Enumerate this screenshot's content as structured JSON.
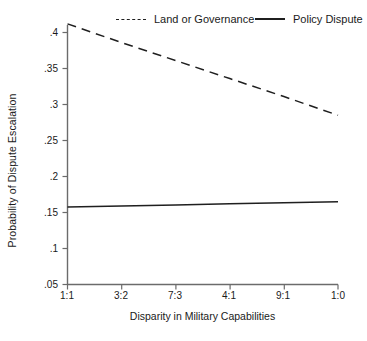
{
  "chart_data": {
    "type": "line",
    "title": "",
    "subtitle": "",
    "xlabel": "Disparity in Military Capabilities",
    "ylabel": "Probability of Dispute Escalation",
    "categories": [
      "1:1",
      "3:2",
      "7:3",
      "4:1",
      "9:1",
      "1:0"
    ],
    "x": [
      0,
      1,
      2,
      3,
      4,
      5
    ],
    "xlim": [
      0,
      5
    ],
    "ylim": [
      0.05,
      0.4
    ],
    "yticks": [
      0.05,
      0.1,
      0.15,
      0.2,
      0.25,
      0.3,
      0.35,
      0.4
    ],
    "ytick_labels": [
      ".05",
      ".1",
      ".15",
      ".2",
      ".25",
      ".3",
      ".35",
      ".4"
    ],
    "xtick_labels": [
      "1:1",
      "3:2",
      "7:3",
      "4:1",
      "9:1",
      "1:0"
    ],
    "grid": false,
    "legend_position": "top",
    "series": [
      {
        "name": "Land or Governance",
        "style": "dashed",
        "color": "#1f1f1f",
        "values": [
          0.412,
          0.386,
          0.361,
          0.336,
          0.311,
          0.285
        ]
      },
      {
        "name": "Policy Dispute",
        "style": "solid",
        "color": "#1f1f1f",
        "values": [
          0.1575,
          0.159,
          0.1605,
          0.162,
          0.1635,
          0.165
        ]
      }
    ],
    "axis_color": "#6b6b6b",
    "text_color": "#1a1a1a"
  },
  "legend": {
    "items": [
      {
        "label": "Land or Governance",
        "style": "dashed"
      },
      {
        "label": "Policy Dispute",
        "style": "solid"
      }
    ]
  },
  "axes": {
    "y_label": "Probability of Dispute Escalation",
    "x_label": "Disparity in Military Capabilities",
    "y_ticks": [
      ".4",
      ".35",
      ".3",
      ".25",
      ".2",
      ".15",
      ".1",
      ".05"
    ],
    "x_ticks": [
      "1:1",
      "3:2",
      "7:3",
      "4:1",
      "9:1",
      "1:0"
    ]
  }
}
